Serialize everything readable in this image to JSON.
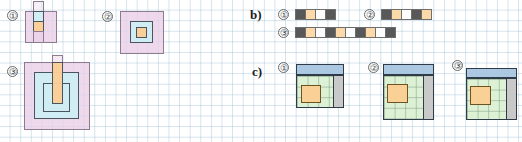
{
  "canvas": {
    "width": 522,
    "height": 142,
    "background": "#ffffff",
    "grid_color": "#96b9d2",
    "grid_size_px": 10.6
  },
  "sections": {
    "a": {
      "label": "",
      "items": [
        {
          "number": "1",
          "marker": "①"
        },
        {
          "number": "2",
          "marker": "②"
        },
        {
          "number": "3",
          "marker": "③"
        }
      ]
    },
    "b": {
      "label": "b)",
      "items": [
        {
          "number": "1",
          "marker": "①",
          "cells": [
            "dark",
            "orange",
            "white",
            "dark"
          ]
        },
        {
          "number": "2",
          "marker": "②",
          "cells": [
            "dark",
            "orange",
            "white",
            "dark",
            "orange"
          ]
        },
        {
          "number": "3",
          "marker": "③",
          "cells": [
            "dark",
            "orange",
            "white",
            "dark",
            "orange",
            "white",
            "dark",
            "orange",
            "white",
            "dark"
          ]
        }
      ]
    },
    "c": {
      "label": "c)",
      "items": [
        {
          "number": "1",
          "marker": "①"
        },
        {
          "number": "2",
          "marker": "②"
        },
        {
          "number": "3",
          "marker": "③"
        }
      ]
    }
  },
  "colors": {
    "pink_fill": "#e9cee7",
    "pink_stroke": "#8d7b92",
    "cyan_fill": "#cdeff5",
    "orange_fill": "#fccd94",
    "dark_cell": "#585858",
    "strip_orange": "#fbd9a8",
    "strip_white": "#fdfdfd",
    "plan_blue": "#a5c3e0",
    "plan_green": "#dbf0d2",
    "plan_grey": "#c4c4c4",
    "plan_orange": "#face94",
    "outline": "#2f3b47"
  }
}
